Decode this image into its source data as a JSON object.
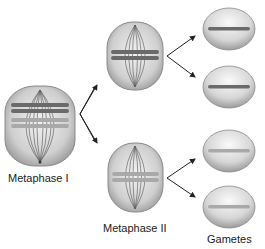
{
  "diagram": {
    "stages": [
      {
        "id": "metaphase-1",
        "label": "Metaphase I"
      },
      {
        "id": "metaphase-2",
        "label": "Metaphase II"
      },
      {
        "id": "gametes",
        "label": "Gametes"
      }
    ],
    "colors": {
      "cell_fill": "#c8c8c8",
      "cell_edge": "#8a8a8a",
      "chromosome_dark": "#6a6a6a",
      "chromosome_light": "#a9a9a9",
      "arrow": "#222222"
    }
  }
}
